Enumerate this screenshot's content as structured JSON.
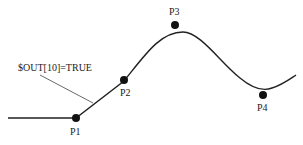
{
  "diagram": {
    "colors": {
      "line": "#222222",
      "point": "#111111",
      "background": "#ffffff"
    },
    "annotation": {
      "text": "$OUT[10]=TRUE"
    },
    "points": [
      {
        "id": "P1",
        "label": "P1"
      },
      {
        "id": "P2",
        "label": "P2"
      },
      {
        "id": "P3",
        "label": "P3"
      },
      {
        "id": "P4",
        "label": "P4"
      }
    ]
  }
}
